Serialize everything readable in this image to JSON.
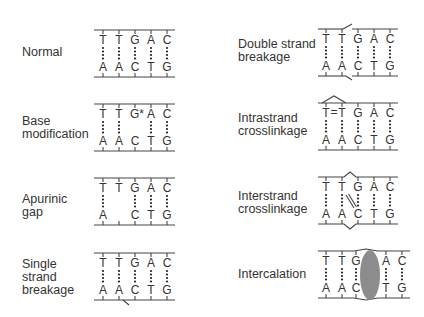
{
  "panels": [
    {
      "id": "normal",
      "label_lines": [
        "Normal"
      ],
      "top": [
        "T",
        "T",
        "G",
        "A",
        "C"
      ],
      "bottom": [
        "A",
        "A",
        "C",
        "T",
        "G"
      ],
      "pairs": [
        true,
        true,
        true,
        true,
        true
      ]
    },
    {
      "id": "base-modification",
      "label_lines": [
        "Base",
        "modification"
      ],
      "top": [
        "T",
        "T",
        "G*",
        "A",
        "C"
      ],
      "bottom": [
        "A",
        "A",
        "C",
        "T",
        "G"
      ],
      "pairs": [
        true,
        true,
        false,
        true,
        true
      ]
    },
    {
      "id": "apurinic-gap",
      "label_lines": [
        "Apurinic",
        "gap"
      ],
      "top": [
        "T",
        "T",
        "G",
        "A",
        "C"
      ],
      "bottom": [
        "A",
        "",
        "C",
        "T",
        "G"
      ],
      "pairs": [
        true,
        false,
        true,
        true,
        true
      ]
    },
    {
      "id": "single-strand-breakage",
      "label_lines": [
        "Single",
        "strand",
        "breakage"
      ],
      "top": [
        "T",
        "T",
        "G",
        "A",
        "C"
      ],
      "bottom": [
        "A",
        "A",
        "C",
        "T",
        "G"
      ],
      "pairs": [
        true,
        true,
        true,
        true,
        true
      ]
    },
    {
      "id": "double-strand-breakage",
      "label_lines": [
        "Double strand",
        "breakage"
      ],
      "top": [
        "T",
        "T",
        "G",
        "A",
        "C"
      ],
      "bottom": [
        "A",
        "A",
        "C",
        "T",
        "G"
      ],
      "pairs": [
        true,
        true,
        true,
        true,
        true
      ]
    },
    {
      "id": "intrastrand-crosslinkage",
      "label_lines": [
        "Intrastrand",
        "crosslinkage"
      ],
      "top": [
        "T=T",
        "",
        "G",
        "A",
        "C"
      ],
      "bottom": [
        "A",
        "A",
        "C",
        "T",
        "G"
      ],
      "pairs": [
        true,
        true,
        true,
        true,
        true
      ]
    },
    {
      "id": "interstrand-crosslinkage",
      "label_lines": [
        "Interstrand",
        "crosslinkage"
      ],
      "top": [
        "T",
        "T",
        "G",
        "A",
        "C"
      ],
      "bottom": [
        "A",
        "A",
        "C",
        "T",
        "G"
      ],
      "pairs": [
        true,
        true,
        true,
        true,
        true
      ]
    },
    {
      "id": "intercalation",
      "label_lines": [
        "Intercalation"
      ],
      "top": [
        "T",
        "T",
        "G",
        "A",
        "C"
      ],
      "bottom": [
        "A",
        "A",
        "C",
        "T",
        "G"
      ],
      "pairs": [
        true,
        true,
        true,
        true,
        true
      ]
    }
  ],
  "labels": {
    "normal": "Normal",
    "base_mod_1": "Base",
    "base_mod_2": "modification",
    "apurinic_1": "Apurinic",
    "apurinic_2": "gap",
    "single_1": "Single",
    "single_2": "strand",
    "single_3": "breakage",
    "double_1": "Double strand",
    "double_2": "breakage",
    "intra_1": "Intrastrand",
    "intra_2": "crosslinkage",
    "inter_1": "Interstrand",
    "inter_2": "crosslinkage",
    "intercalation": "Intercalation"
  },
  "colors": {
    "intercalator": "#8c8c8c",
    "line": "#444444"
  }
}
